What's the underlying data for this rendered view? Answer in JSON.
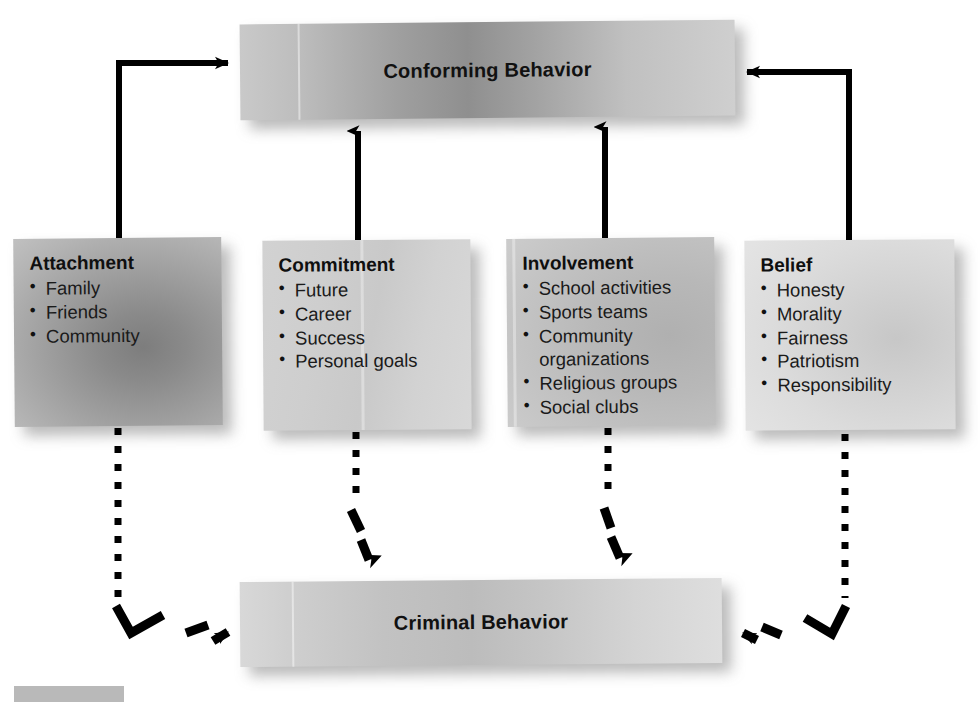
{
  "diagram": {
    "top_node": {
      "label": "Conforming Behavior"
    },
    "bottom_node": {
      "label": "Criminal Behavior"
    },
    "bonds": [
      {
        "id": "attachment",
        "title": "Attachment",
        "items": [
          "Family",
          "Friends",
          "Community"
        ]
      },
      {
        "id": "commitment",
        "title": "Commitment",
        "items": [
          "Future",
          "Career",
          "Success",
          "Personal goals"
        ]
      },
      {
        "id": "involvement",
        "title": "Involvement",
        "items": [
          "School activities",
          "Sports teams",
          "Community\norganizations",
          "Religious groups",
          "Social clubs"
        ]
      },
      {
        "id": "belief",
        "title": "Belief",
        "items": [
          "Honesty",
          "Morality",
          "Fairness",
          "Patriotism",
          "Responsibility"
        ]
      }
    ],
    "connectors": {
      "solid_to_conforming": [
        "attachment-to-conforming-behavior",
        "commitment-to-conforming-behavior",
        "involvement-to-conforming-behavior",
        "belief-to-conforming-behavior"
      ],
      "dotted_to_criminal": [
        "attachment-to-criminal-behavior",
        "commitment-to-criminal-behavior",
        "involvement-to-criminal-behavior",
        "belief-to-criminal-behavior"
      ]
    },
    "colors": {
      "line": "#000000",
      "text": "#111111",
      "banner_dark": "#8f8f8f",
      "banner_light": "#c6c6c6",
      "swatch": "#b9b9b9",
      "background": "#ffffff"
    }
  }
}
